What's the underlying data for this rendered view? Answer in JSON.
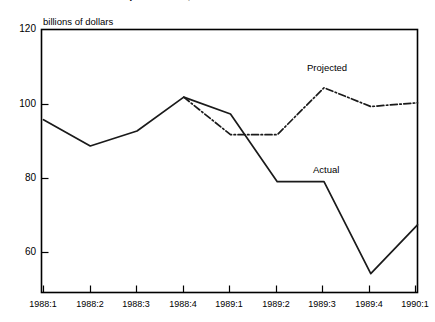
{
  "figure": {
    "clipped_title": "business expenditures, 1988-90",
    "unit_label": "billions of dollars"
  },
  "annotations": {
    "projected": "Projected",
    "actual": "Actual"
  },
  "axis": {
    "y_ticks": [
      "120",
      "100",
      "80",
      "60"
    ],
    "x_ticks": [
      "1988:1",
      "1988:2",
      "1988:3",
      "1988:4",
      "1989:1",
      "1989:2",
      "1989:3",
      "1989:4",
      "1990:1"
    ]
  },
  "chart_data": {
    "type": "line",
    "title": "business expenditures, 1988-90",
    "xlabel": "",
    "ylabel": "billions of dollars",
    "ylim": [
      50,
      120
    ],
    "yticks": [
      60,
      80,
      100,
      120
    ],
    "grid": false,
    "legend": "inline-annotation",
    "categories": [
      "1988:1",
      "1988:2",
      "1988:3",
      "1988:4",
      "1989:1",
      "1989:2",
      "1989:3",
      "1989:4",
      "1990:1"
    ],
    "series": [
      {
        "name": "Actual",
        "style": "solid",
        "color": "#1a1a1a",
        "values": [
          96,
          89,
          93,
          102,
          97.5,
          79.5,
          79.5,
          55,
          68
        ]
      },
      {
        "name": "Projected",
        "style": "dashed",
        "color": "#1a1a1a",
        "values": [
          null,
          null,
          null,
          102,
          92,
          92,
          104.5,
          99.5,
          100.5
        ]
      }
    ]
  },
  "colors": {
    "line": "#1a1a1a",
    "axis": "#000000",
    "background": "#ffffff"
  }
}
